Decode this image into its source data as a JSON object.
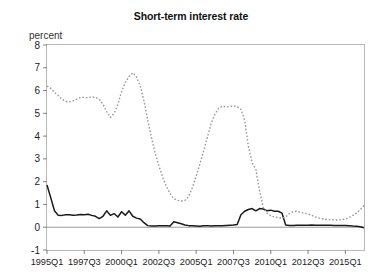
{
  "chart": {
    "title": "Short-term interest rate",
    "ylabel_text": "percent"
  },
  "chart_data": {
    "type": "line",
    "title": "Short-term interest rate",
    "xlabel": "",
    "ylabel": "percent",
    "ylim": [
      -1,
      8
    ],
    "ytick_labels": [
      "8",
      "7",
      "6",
      "5",
      "4",
      "3",
      "2",
      "1",
      "0",
      "-1"
    ],
    "yticks": [
      8,
      7,
      6,
      5,
      4,
      3,
      2,
      1,
      0,
      -1
    ],
    "xtick_labels": [
      "1995Q1",
      "1997Q3",
      "2000Q1",
      "2002Q3",
      "2005Q1",
      "2007Q3",
      "2010Q1",
      "2012Q3",
      "2015Q1"
    ],
    "xtick_indices": [
      0,
      10,
      20,
      30,
      40,
      50,
      60,
      70,
      80
    ],
    "grid": false,
    "zero_line": true,
    "legend": "none",
    "x": [
      "1995Q1",
      "1995Q2",
      "1995Q3",
      "1995Q4",
      "1996Q1",
      "1996Q2",
      "1996Q3",
      "1996Q4",
      "1997Q1",
      "1997Q2",
      "1997Q3",
      "1997Q4",
      "1998Q1",
      "1998Q2",
      "1998Q3",
      "1998Q4",
      "1999Q1",
      "1999Q2",
      "1999Q3",
      "1999Q4",
      "2000Q1",
      "2000Q2",
      "2000Q3",
      "2000Q4",
      "2001Q1",
      "2001Q2",
      "2001Q3",
      "2001Q4",
      "2002Q1",
      "2002Q2",
      "2002Q3",
      "2002Q4",
      "2003Q1",
      "2003Q2",
      "2003Q3",
      "2003Q4",
      "2004Q1",
      "2004Q2",
      "2004Q3",
      "2004Q4",
      "2005Q1",
      "2005Q2",
      "2005Q3",
      "2005Q4",
      "2006Q1",
      "2006Q2",
      "2006Q3",
      "2006Q4",
      "2007Q1",
      "2007Q2",
      "2007Q3",
      "2007Q4",
      "2008Q1",
      "2008Q2",
      "2008Q3",
      "2008Q4",
      "2009Q1",
      "2009Q2",
      "2009Q3",
      "2009Q4",
      "2010Q1",
      "2010Q2",
      "2010Q3",
      "2010Q4",
      "2011Q1",
      "2011Q2",
      "2011Q3",
      "2011Q4",
      "2012Q1",
      "2012Q2",
      "2012Q3",
      "2012Q4",
      "2013Q1",
      "2013Q2",
      "2013Q3",
      "2013Q4",
      "2014Q1",
      "2014Q2",
      "2014Q3",
      "2014Q4",
      "2015Q1",
      "2015Q2",
      "2015Q3",
      "2015Q4",
      "2016Q1",
      "2016Q2"
    ],
    "series": [
      {
        "name": "solid-series",
        "style": "solid",
        "color": "#1a1a1a",
        "values": [
          1.85,
          1.3,
          0.72,
          0.53,
          0.52,
          0.55,
          0.55,
          0.53,
          0.54,
          0.56,
          0.55,
          0.57,
          0.52,
          0.48,
          0.38,
          0.48,
          0.72,
          0.52,
          0.6,
          0.45,
          0.68,
          0.53,
          0.72,
          0.48,
          0.4,
          0.36,
          0.2,
          0.07,
          0.05,
          0.05,
          0.06,
          0.06,
          0.06,
          0.05,
          0.24,
          0.2,
          0.15,
          0.1,
          0.07,
          0.06,
          0.05,
          0.04,
          0.06,
          0.07,
          0.05,
          0.06,
          0.07,
          0.07,
          0.08,
          0.09,
          0.1,
          0.12,
          0.55,
          0.7,
          0.78,
          0.82,
          0.72,
          0.82,
          0.8,
          0.72,
          0.75,
          0.7,
          0.7,
          0.62,
          0.1,
          0.08,
          0.08,
          0.09,
          0.09,
          0.09,
          0.09,
          0.1,
          0.09,
          0.09,
          0.09,
          0.09,
          0.09,
          0.08,
          0.08,
          0.08,
          0.08,
          0.07,
          0.05,
          0.04,
          0.02,
          -0.02
        ]
      },
      {
        "name": "dashed-series",
        "style": "dashed",
        "color": "#9a9a9a",
        "values": [
          6.2,
          6.1,
          5.92,
          5.78,
          5.62,
          5.52,
          5.5,
          5.55,
          5.62,
          5.7,
          5.7,
          5.68,
          5.72,
          5.7,
          5.62,
          5.4,
          5.08,
          4.82,
          5.0,
          5.4,
          5.95,
          6.35,
          6.62,
          6.78,
          6.6,
          6.2,
          5.55,
          4.7,
          3.95,
          3.25,
          2.7,
          2.2,
          1.8,
          1.48,
          1.25,
          1.18,
          1.15,
          1.18,
          1.35,
          1.75,
          2.25,
          2.78,
          3.35,
          3.95,
          4.55,
          4.95,
          5.22,
          5.32,
          5.28,
          5.3,
          5.32,
          5.3,
          5.18,
          4.7,
          3.55,
          2.82,
          2.55,
          1.6,
          0.85,
          0.62,
          0.5,
          0.45,
          0.42,
          0.4,
          0.45,
          0.6,
          0.68,
          0.7,
          0.65,
          0.62,
          0.58,
          0.52,
          0.45,
          0.4,
          0.36,
          0.34,
          0.33,
          0.32,
          0.32,
          0.33,
          0.36,
          0.42,
          0.52,
          0.62,
          0.78,
          0.95
        ]
      }
    ]
  }
}
